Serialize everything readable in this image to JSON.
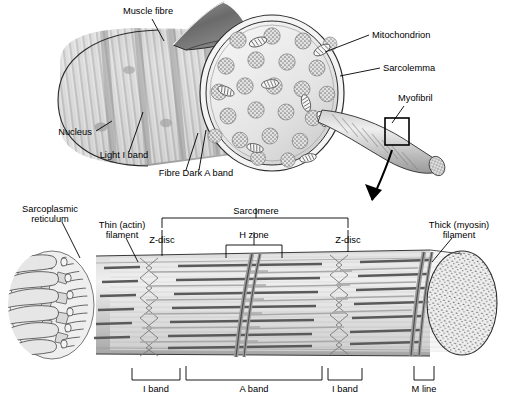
{
  "figure": {
    "colors": {
      "outline": "#1a1a1a",
      "fibre_light": "#e8e8e8",
      "fibre_mid": "#cccccc",
      "fibre_dark": "#9a9a9a",
      "flap_dark": "#6e6e6e",
      "myofibril_dot": "#8a8a8a",
      "mitochondrion_fill": "#f2f2f2",
      "thick_filament": "#5a5a5a",
      "thin_filament": "#a8a8a8",
      "background": "#ffffff"
    }
  },
  "top_panel": {
    "name": "muscle-fibre-overview",
    "labels": [
      {
        "id": "muscle-fibre",
        "text": "Muscle fibre",
        "x": 148,
        "y": 14,
        "anchor": "middle"
      },
      {
        "id": "mitochondrion",
        "text": "Mitochondrion",
        "x": 372,
        "y": 38,
        "anchor": "start"
      },
      {
        "id": "sarcolemma",
        "text": "Sarcolemma",
        "x": 383,
        "y": 71,
        "anchor": "start"
      },
      {
        "id": "myofibril",
        "text": "Myofibril",
        "x": 398,
        "y": 101,
        "anchor": "start"
      },
      {
        "id": "nucleus",
        "text": "Nucleus",
        "x": 75,
        "y": 135,
        "anchor": "middle"
      },
      {
        "id": "light-i-band",
        "text": "Light I band",
        "x": 124,
        "y": 158,
        "anchor": "middle"
      },
      {
        "id": "fibre-dark-a-band",
        "text": "Fibre Dark A band",
        "x": 196,
        "y": 176,
        "anchor": "middle"
      }
    ]
  },
  "bottom_panel": {
    "name": "myofibril-sarcomere-detail",
    "labels": [
      {
        "id": "sarcoplasmic-reticulum",
        "line1": "Sarcoplasmic",
        "line2": "reticulum",
        "x": 50,
        "y": 212
      },
      {
        "id": "thin-actin-filament",
        "line1": "Thin (actin)",
        "line2": "filament",
        "x": 122,
        "y": 228
      },
      {
        "id": "thick-myosin-filament",
        "line1": "Thick (myosin)",
        "line2": "filament",
        "x": 459,
        "y": 228
      },
      {
        "id": "sarcomere",
        "text": "Sarcomere",
        "x": 256,
        "y": 214,
        "anchor": "middle"
      },
      {
        "id": "h-zone",
        "text": "H zone",
        "x": 254,
        "y": 238,
        "anchor": "middle"
      },
      {
        "id": "z-disc-left",
        "text": "Z-disc",
        "x": 162,
        "y": 243,
        "anchor": "middle"
      },
      {
        "id": "z-disc-right",
        "text": "Z-disc",
        "x": 348,
        "y": 243,
        "anchor": "middle"
      }
    ],
    "band_labels": [
      {
        "id": "i-band-left",
        "text": "I band",
        "x": 156,
        "y": 389
      },
      {
        "id": "a-band",
        "text": "A band",
        "x": 254,
        "y": 389
      },
      {
        "id": "i-band-right",
        "text": "I band",
        "x": 345,
        "y": 389
      },
      {
        "id": "m-line",
        "text": "M line",
        "x": 424,
        "y": 389
      }
    ]
  }
}
